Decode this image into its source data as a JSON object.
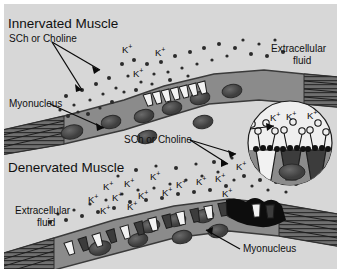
{
  "figure": {
    "title_top": "Innervated Muscle",
    "title_bottom": "Denervated Muscle",
    "background_color": "#d7d7d7",
    "muscle_fill": "#8b8b8b",
    "muscle_edge": "#3a3a3a",
    "nucleus_color": "#4a4a4a",
    "channel_light": "#f2f2f2",
    "channel_dark": "#3c3c3c",
    "nerve_terminal_color": "#0d0d0d",
    "ion_color": "#2b2b2b",
    "inset_fill": "#efefef"
  },
  "labels": {
    "innervated_muscle": "Innervated Muscle",
    "sch_or_choline_top": "SCh or Choline",
    "extracellular_fluid_top": "Extracellular",
    "extracellular_fluid_top2": "fluid",
    "myonucleus_top": "Myonucleus",
    "sch_or_choline_mid": "SCh or Choline",
    "denervated_muscle": "Denervated Muscle",
    "extracellular_fluid_bottom": "Extracellular",
    "extracellular_fluid_bottom2": "fluid",
    "myonucleus_bottom": "Myonucleus"
  },
  "ion_label": "K",
  "ion_charge": "+",
  "ions_top": [
    {
      "x": 122,
      "y": 44
    },
    {
      "x": 155,
      "y": 47
    },
    {
      "x": 133,
      "y": 68
    }
  ],
  "ions_bottom": [
    {
      "x": 103,
      "y": 181
    },
    {
      "x": 124,
      "y": 178
    },
    {
      "x": 150,
      "y": 171
    },
    {
      "x": 176,
      "y": 179
    },
    {
      "x": 196,
      "y": 176
    },
    {
      "x": 215,
      "y": 173
    },
    {
      "x": 88,
      "y": 194
    },
    {
      "x": 112,
      "y": 192
    },
    {
      "x": 138,
      "y": 190
    },
    {
      "x": 162,
      "y": 187
    },
    {
      "x": 222,
      "y": 188
    },
    {
      "x": 236,
      "y": 161
    },
    {
      "x": 100,
      "y": 205
    },
    {
      "x": 127,
      "y": 201
    }
  ],
  "ions_inset": [
    {
      "x": 270,
      "y": 112
    },
    {
      "x": 286,
      "y": 111
    },
    {
      "x": 307,
      "y": 110
    }
  ],
  "inset": {
    "cx": 290,
    "cy": 143,
    "r": 42,
    "channel_count": 3
  },
  "channels_top": {
    "count": 7,
    "description": "acetylcholine-receptor-cluster-endplate"
  },
  "channels_bottom": {
    "count": 14,
    "description": "acetylcholine-receptors-spread-along-fiber"
  }
}
